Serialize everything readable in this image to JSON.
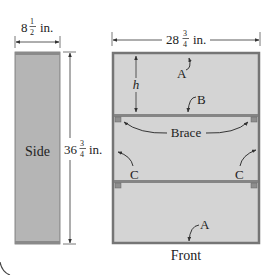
{
  "diagram": {
    "side_view": {
      "label": "Side",
      "width_label": {
        "whole": "8",
        "num": "1",
        "den": "2",
        "unit": "in."
      },
      "height_label": {
        "whole": "36",
        "num": "3",
        "den": "4",
        "unit": "in."
      }
    },
    "front_view": {
      "label": "Front",
      "width_label": {
        "whole": "28",
        "num": "3",
        "den": "4",
        "unit": "in."
      },
      "height_var": "h",
      "parts": {
        "A_top": "A",
        "A_bottom": "A",
        "B": "B",
        "brace": "Brace",
        "C_left": "C",
        "C_right": "C"
      }
    },
    "colors": {
      "panel_fill": "#b7b7b7",
      "panel_edge": "#6e6e6e",
      "front_fill": "#d6d6d6",
      "frame": "#7a7a7a",
      "line": "#333333"
    }
  }
}
